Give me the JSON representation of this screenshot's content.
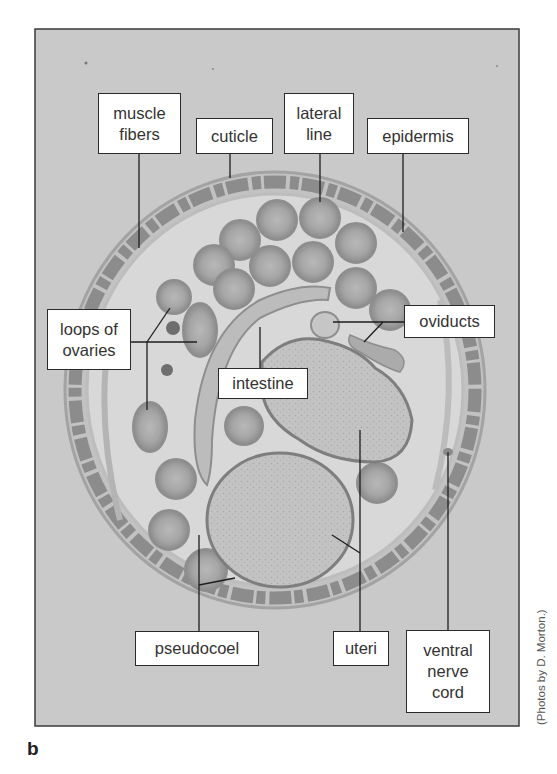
{
  "figure": {
    "panel_letter": "b",
    "credit": "(Photos by D. Morton.)",
    "colors": {
      "background": "#c9c9c9",
      "frame_border": "#3a3a3a",
      "label_border": "#2a2a2a",
      "label_text": "#333333",
      "tissue_dark": "#8a8a8a",
      "tissue_mid": "#a8a8a8",
      "tissue_light": "#d6d6d6"
    }
  },
  "labels": {
    "muscle_fibers": "muscle\nfibers",
    "cuticle": "cuticle",
    "lateral_line": "lateral\nline",
    "epidermis": "epidermis",
    "loops_of_ovaries": "loops of\novaries",
    "oviducts": "oviducts",
    "intestine": "intestine",
    "pseudocoel": "pseudocoel",
    "uteri": "uteri",
    "ventral_nerve_cord": "ventral\nnerve\ncord"
  }
}
